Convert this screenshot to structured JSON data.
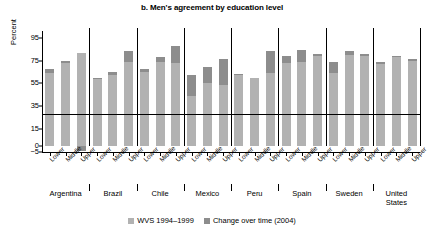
{
  "chart_data": {
    "type": "bar",
    "subtype": "stacked-bar",
    "title": "b. Men's agreement by education level",
    "xlabel": "",
    "ylabel": "Percent",
    "ylim": [
      -5,
      100
    ],
    "yticks": [
      -5,
      0,
      15,
      35,
      55,
      75,
      95
    ],
    "ytick_labels": [
      "−5",
      "0",
      "15",
      "35",
      "55",
      "75",
      "95"
    ],
    "grid": false,
    "legend_position": "bottom-center",
    "legend": [
      {
        "name": "WVS 1994–1999",
        "color": "#b2b2b2"
      },
      {
        "name": "Change over time (2004)",
        "color": "#8d8d8d"
      }
    ],
    "groups": [
      "Argentina",
      "Brazil",
      "Chile",
      "Mexico",
      "Peru",
      "Spain",
      "Sweden",
      "United States"
    ],
    "categories": [
      "Lower",
      "Middle",
      "Upper",
      "Lower",
      "Middle",
      "Upper",
      "Lower",
      "Middle",
      "Upper",
      "Lower",
      "Middle",
      "Upper",
      "Lower",
      "Middle",
      "Upper",
      "Lower",
      "Middle",
      "Upper",
      "Lower",
      "Middle",
      "Upper",
      "Lower",
      "Middle",
      "Upper"
    ],
    "series": [
      {
        "name": "WVS 1994–1999",
        "color": "#b2b2b2",
        "values": [
          64,
          73,
          82,
          59,
          62,
          74,
          65,
          74,
          73,
          44,
          55,
          54,
          62,
          60,
          64,
          73,
          74,
          79,
          64,
          80,
          79,
          72,
          78,
          75
        ]
      },
      {
        "name": "Change over time (2004)",
        "color": "#8d8d8d",
        "values": [
          4,
          2,
          -4,
          1,
          3,
          9,
          3,
          4,
          15,
          18,
          14,
          22,
          1,
          0,
          19,
          6,
          10,
          2,
          10,
          3,
          2,
          2,
          1,
          1
        ]
      }
    ],
    "totals": [
      68,
      75,
      82,
      60,
      65,
      83,
      68,
      78,
      88,
      62,
      69,
      76,
      63,
      60,
      83,
      79,
      84,
      81,
      74,
      83,
      81,
      74,
      79,
      76
    ]
  },
  "legend": {
    "items": [
      {
        "label": "WVS 1994–1999"
      },
      {
        "label": "Change over time (2004)"
      }
    ]
  },
  "axis": {
    "y_title": "Percent"
  },
  "groups": [
    {
      "label": "Argentina"
    },
    {
      "label": "Brazil"
    },
    {
      "label": "Chile"
    },
    {
      "label": "Mexico"
    },
    {
      "label": "Peru"
    },
    {
      "label": "Spain"
    },
    {
      "label": "Sweden"
    },
    {
      "label": "United States"
    }
  ]
}
